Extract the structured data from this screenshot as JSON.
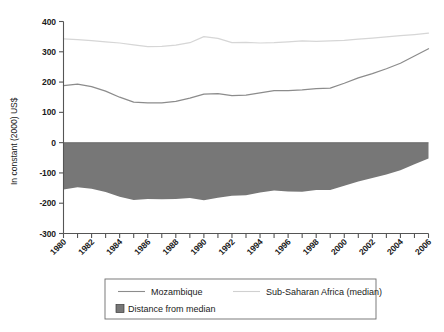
{
  "chart_data": {
    "type": "line",
    "title": "",
    "subtitle": "",
    "xlabel": "",
    "ylabel": "In constant (2000) US$",
    "xlim": [
      1980,
      2006
    ],
    "ylim": [
      -300,
      400
    ],
    "yticks": [
      400,
      300,
      200,
      100,
      0,
      -100,
      -200,
      -300
    ],
    "ytick_labels": [
      "400",
      "300",
      "200",
      "100",
      "0",
      "-100",
      "-200",
      "-300"
    ],
    "xticks": [
      1980,
      1981,
      1982,
      1983,
      1984,
      1985,
      1986,
      1987,
      1988,
      1989,
      1990,
      1991,
      1992,
      1993,
      1994,
      1995,
      1996,
      1997,
      1998,
      1999,
      2000,
      2001,
      2002,
      2003,
      2004,
      2005,
      2006
    ],
    "xtick_labels_shown": [
      "1980",
      "1982",
      "1984",
      "1986",
      "1988",
      "1990",
      "1992",
      "1994",
      "1996",
      "1998",
      "2000",
      "2002",
      "2004",
      "2006"
    ],
    "grid": false,
    "legend_position": "bottom",
    "x": [
      1980,
      1981,
      1982,
      1983,
      1984,
      1985,
      1986,
      1987,
      1988,
      1989,
      1990,
      1991,
      1992,
      1993,
      1994,
      1995,
      1996,
      1997,
      1998,
      1999,
      2000,
      2001,
      2002,
      2003,
      2004,
      2005,
      2006
    ],
    "series": [
      {
        "name": "Sub-Saharan Africa (median)",
        "color": "#d6d6d6",
        "type": "line",
        "values": [
          343,
          340,
          337,
          333,
          329,
          323,
          317,
          318,
          322,
          330,
          350,
          344,
          330,
          331,
          329,
          330,
          333,
          336,
          334,
          336,
          338,
          342,
          345,
          349,
          353,
          357,
          362
        ]
      },
      {
        "name": "Mozambique",
        "color": "#8c8c8c",
        "type": "line",
        "values": [
          188,
          193,
          185,
          170,
          150,
          134,
          131,
          131,
          136,
          147,
          160,
          162,
          155,
          157,
          164,
          172,
          172,
          174,
          178,
          180,
          196,
          214,
          228,
          244,
          262,
          286,
          310
        ]
      },
      {
        "name": "Distance from median",
        "color": "#777777",
        "type": "area",
        "values": [
          -155,
          -147,
          -152,
          -163,
          -179,
          -189,
          -186,
          -187,
          -186,
          -183,
          -190,
          -182,
          -175,
          -174,
          -165,
          -158,
          -161,
          -162,
          -156,
          -156,
          -142,
          -128,
          -117,
          -105,
          -91,
          -71,
          -52
        ]
      }
    ],
    "legend": [
      {
        "label": "Mozambique",
        "marker": "line",
        "color": "#8c8c8c"
      },
      {
        "label": "Sub-Saharan Africa (median)",
        "marker": "line",
        "color": "#d6d6d6"
      },
      {
        "label": "Distance from median",
        "marker": "swatch",
        "color": "#777777"
      }
    ]
  },
  "axis": {
    "y_axis_title": "In constant (2000) US$",
    "y_labels": [
      "400",
      "300",
      "200",
      "100",
      "0",
      "-100",
      "-200",
      "-300"
    ],
    "x_labels": [
      "1980",
      "1982",
      "1984",
      "1986",
      "1988",
      "1990",
      "1992",
      "1994",
      "1996",
      "1998",
      "2000",
      "2002",
      "2004",
      "2006"
    ]
  },
  "legend": {
    "mozambique_label": "Mozambique",
    "ssa_label": "Sub-Saharan Africa (median)",
    "distance_label": "Distance from median"
  },
  "colors": {
    "mozambique": "#8c8c8c",
    "ssa_median": "#d6d6d6",
    "distance_fill": "#777777",
    "axis": "#555555",
    "text": "#1a1a1a"
  }
}
